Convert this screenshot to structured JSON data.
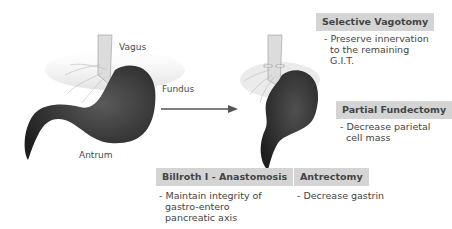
{
  "left_stomach": {
    "labels": {
      "vagus": "Vagus",
      "fundus": "Fundus",
      "antrum": "Antrum"
    }
  },
  "procedures": [
    {
      "title": "Selective Vagotomy",
      "description": "- Preserve innervation\n  to the remaining\n  G.I.T."
    },
    {
      "title": "Partial Fundectomy",
      "description": "- Decrease parietal\n  cell mass"
    },
    {
      "title": "Billroth I - Anastomosis",
      "description": "- Maintain integrity of\n  gastro-entero\n  pancreatic axis"
    },
    {
      "title": "Antrectomy",
      "description": "- Decrease gastrin"
    }
  ],
  "colors": {
    "label_box": "#d4d4d4",
    "stomach_dark": "#2a2a2a",
    "arrow": "#555555"
  }
}
